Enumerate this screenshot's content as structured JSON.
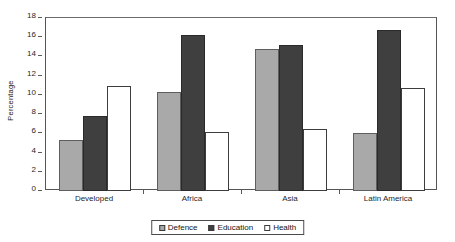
{
  "chart_data": {
    "type": "bar",
    "title": "",
    "xlabel": "",
    "ylabel": "Percentage",
    "categories": [
      "Developed",
      "Africa",
      "Asia",
      "Latin America"
    ],
    "series": [
      {
        "name": "Defence",
        "color": "#a9a9a9",
        "values": [
          5.3,
          10.3,
          14.8,
          6.0
        ]
      },
      {
        "name": "Education",
        "color": "#3f3f3f",
        "values": [
          7.8,
          16.2,
          15.2,
          16.8
        ]
      },
      {
        "name": "Health",
        "color": "#ffffff",
        "values": [
          10.9,
          6.1,
          6.4,
          10.7
        ]
      }
    ],
    "ylim": [
      0,
      18
    ],
    "yticks": [
      0,
      2,
      4,
      6,
      8,
      10,
      12,
      14,
      16,
      18
    ],
    "grid": false,
    "legend_position": "bottom"
  }
}
